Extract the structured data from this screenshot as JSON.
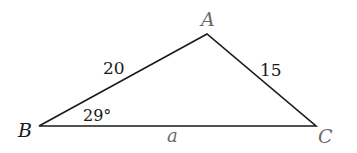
{
  "diagram": {
    "type": "triangle",
    "vertices": {
      "A": {
        "label": "A",
        "x": 207,
        "y": 34
      },
      "B": {
        "label": "B",
        "x": 39,
        "y": 126
      },
      "C": {
        "label": "C",
        "x": 316,
        "y": 126
      }
    },
    "sides": {
      "AB": {
        "label": "20"
      },
      "AC": {
        "label": "15"
      },
      "BC": {
        "label": "a"
      }
    },
    "angles": {
      "B": {
        "label": "29°"
      }
    },
    "colors": {
      "line": "#1a1a1a",
      "dark_text": "#1a1a1a",
      "gray_text": "#6b6b6b"
    }
  }
}
